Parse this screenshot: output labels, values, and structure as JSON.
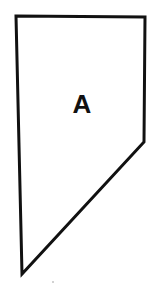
{
  "diagram": {
    "shape": "pentagon",
    "label": "A",
    "colors": {
      "stroke": "#111111",
      "fill": "#ffffff",
      "label": "#111111",
      "background": "#ffffff"
    }
  }
}
